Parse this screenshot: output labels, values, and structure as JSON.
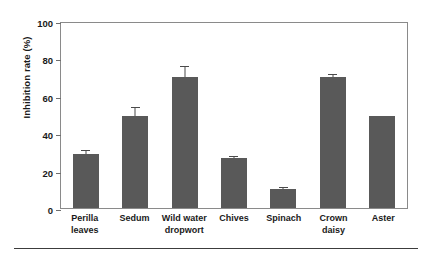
{
  "chart_data": {
    "type": "bar",
    "title": "",
    "xlabel": "",
    "ylabel": "Inhibition rate (%)",
    "ylim": [
      0,
      100
    ],
    "yticks": [
      0,
      20,
      40,
      60,
      80,
      100
    ],
    "ytick_labels": [
      "0",
      "20",
      "40",
      "60",
      "80",
      "100"
    ],
    "grid": false,
    "legend": null,
    "bar_color": "#595959",
    "categories": [
      "Perilla leaves",
      "Sedum",
      "Wild water dropwort",
      "Chives",
      "Spinach",
      "Crown daisy",
      "Aster"
    ],
    "category_lines": [
      [
        "Perilla",
        "leaves"
      ],
      [
        "Sedum",
        ""
      ],
      [
        "Wild water",
        "dropwort"
      ],
      [
        "Chives",
        ""
      ],
      [
        "Spinach",
        ""
      ],
      [
        "Crown daisy",
        ""
      ],
      [
        "Aster",
        ""
      ]
    ],
    "values": [
      29,
      49,
      70,
      27,
      10,
      70,
      49
    ],
    "errors": [
      2,
      5,
      6,
      1,
      1,
      1.5,
      0
    ]
  }
}
